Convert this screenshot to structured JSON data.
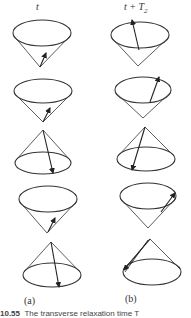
{
  "figure": {
    "column_headers": {
      "a": {
        "main": "t",
        "sub": ""
      },
      "b": {
        "main": "t + T",
        "sub": "2"
      }
    },
    "panel_labels": {
      "a": "(a)",
      "b": "(b)"
    },
    "caption": {
      "number": "10.55",
      "text": "The transverse relaxation time T"
    },
    "stroke_color": "#333333",
    "cones": [
      {
        "column": "a",
        "row": 1,
        "orientation": "apex-down",
        "ellipse": {
          "cx": 42,
          "cy": 33,
          "rx": 29,
          "ry": 13
        },
        "apex": {
          "x": 40,
          "y": 67
        },
        "arrow": {
          "x1": 40,
          "y1": 67,
          "x2": 46,
          "y2": 53
        }
      },
      {
        "column": "a",
        "row": 2,
        "orientation": "apex-down",
        "ellipse": {
          "cx": 43,
          "cy": 91,
          "rx": 29,
          "ry": 12
        },
        "apex": {
          "x": 43,
          "y": 122
        },
        "arrow": {
          "x1": 43,
          "y1": 122,
          "x2": 50,
          "y2": 108
        }
      },
      {
        "column": "a",
        "row": 3,
        "orientation": "apex-up",
        "ellipse": {
          "cx": 43,
          "cy": 163,
          "rx": 28,
          "ry": 11
        },
        "apex": {
          "x": 43,
          "y": 130
        },
        "arrow": {
          "x1": 43,
          "y1": 130,
          "x2": 53,
          "y2": 173
        }
      },
      {
        "column": "a",
        "row": 4,
        "orientation": "apex-down",
        "ellipse": {
          "cx": 48,
          "cy": 199,
          "rx": 29,
          "ry": 13
        },
        "apex": {
          "x": 47,
          "y": 233
        },
        "arrow": {
          "x1": 48,
          "y1": 232,
          "x2": 55,
          "y2": 218
        }
      },
      {
        "column": "a",
        "row": 5,
        "orientation": "apex-up",
        "ellipse": {
          "cx": 52,
          "cy": 275,
          "rx": 29,
          "ry": 12
        },
        "apex": {
          "x": 51,
          "y": 242
        },
        "arrow": {
          "x1": 51,
          "y1": 242,
          "x2": 59,
          "y2": 287
        }
      },
      {
        "column": "b",
        "row": 1,
        "orientation": "apex-down",
        "ellipse": {
          "cx": 140,
          "cy": 35,
          "rx": 29,
          "ry": 13
        },
        "apex": {
          "x": 138,
          "y": 66
        },
        "arrow": {
          "x1": 139,
          "y1": 50,
          "x2": 132,
          "y2": 20
        }
      },
      {
        "column": "b",
        "row": 2,
        "orientation": "apex-down",
        "ellipse": {
          "cx": 143,
          "cy": 90,
          "rx": 28,
          "ry": 13
        },
        "apex": {
          "x": 143,
          "y": 118
        },
        "arrow": {
          "x1": 150,
          "y1": 102,
          "x2": 159,
          "y2": 77
        }
      },
      {
        "column": "b",
        "row": 3,
        "orientation": "apex-up",
        "ellipse": {
          "cx": 146,
          "cy": 159,
          "rx": 29,
          "ry": 12
        },
        "apex": {
          "x": 145,
          "y": 127
        },
        "arrow": {
          "x1": 145,
          "y1": 127,
          "x2": 132,
          "y2": 170
        }
      },
      {
        "column": "b",
        "row": 4,
        "orientation": "apex-down",
        "ellipse": {
          "cx": 148,
          "cy": 196,
          "rx": 28,
          "ry": 13
        },
        "apex": {
          "x": 148,
          "y": 228
        },
        "arrow": {
          "x1": 161,
          "y1": 212,
          "x2": 175,
          "y2": 193
        }
      },
      {
        "column": "b",
        "row": 5,
        "orientation": "apex-up",
        "ellipse": {
          "cx": 152,
          "cy": 272,
          "rx": 29,
          "ry": 13
        },
        "apex": {
          "x": 150,
          "y": 239
        },
        "arrow": {
          "x1": 150,
          "y1": 239,
          "x2": 124,
          "y2": 270
        },
        "double_line": true
      }
    ]
  }
}
